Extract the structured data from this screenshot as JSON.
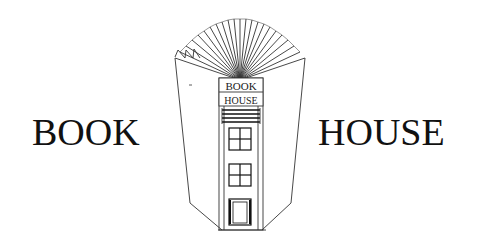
{
  "logo": {
    "left_word": "BOOK",
    "right_word": "HOUSE",
    "sign_line_1": "BOOK",
    "sign_line_2": "HOUSE",
    "icon": "open-book-townhouse-icon",
    "ink_color": "#111111",
    "background_color": "#ffffff"
  }
}
